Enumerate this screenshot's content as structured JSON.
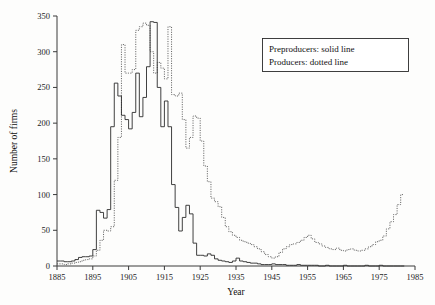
{
  "chart_data": {
    "type": "line",
    "title": "",
    "xlabel": "Year",
    "ylabel": "Number of firms",
    "xlim": [
      1885,
      1985
    ],
    "ylim": [
      0,
      350
    ],
    "xticks": [
      1885,
      1895,
      1905,
      1915,
      1925,
      1935,
      1945,
      1955,
      1965,
      1975,
      1985
    ],
    "yticks": [
      0,
      50,
      100,
      150,
      200,
      250,
      300,
      350
    ],
    "grid": false,
    "legend_position": "top-right",
    "step_style": "steps-post",
    "series": [
      {
        "name": "Preproducers",
        "style": "solid line",
        "x": [
          1885,
          1886,
          1887,
          1888,
          1889,
          1890,
          1891,
          1892,
          1893,
          1894,
          1895,
          1896,
          1897,
          1898,
          1899,
          1900,
          1901,
          1902,
          1903,
          1904,
          1905,
          1906,
          1907,
          1908,
          1909,
          1910,
          1911,
          1912,
          1913,
          1914,
          1915,
          1916,
          1917,
          1918,
          1919,
          1920,
          1921,
          1922,
          1923,
          1924,
          1925,
          1926,
          1927,
          1928,
          1929,
          1930,
          1931,
          1932,
          1933,
          1934,
          1935,
          1936,
          1937,
          1938,
          1939,
          1940,
          1941,
          1942,
          1943,
          1944,
          1945,
          1946,
          1947,
          1948,
          1949,
          1950,
          1951,
          1952,
          1953,
          1954,
          1955,
          1956,
          1957,
          1958,
          1959,
          1960,
          1961,
          1962,
          1963,
          1964,
          1965,
          1966,
          1967,
          1968,
          1969,
          1970,
          1971,
          1972,
          1973,
          1974,
          1975,
          1976,
          1977,
          1978,
          1979,
          1980,
          1981
        ],
        "values": [
          7,
          7,
          6,
          6,
          7,
          9,
          12,
          13,
          13,
          14,
          23,
          78,
          75,
          67,
          79,
          195,
          256,
          238,
          211,
          205,
          192,
          215,
          270,
          209,
          236,
          279,
          342,
          341,
          250,
          195,
          231,
          195,
          114,
          82,
          49,
          68,
          85,
          73,
          32,
          15,
          15,
          14,
          17,
          15,
          10,
          8,
          7,
          6,
          5,
          7,
          11,
          7,
          6,
          5,
          4,
          4,
          3,
          2,
          2,
          2,
          3,
          2,
          2,
          2,
          1,
          1,
          1,
          2,
          1,
          1,
          1,
          1,
          1,
          0,
          0,
          1,
          0,
          0,
          0,
          0,
          1,
          0,
          0,
          0,
          0,
          0,
          1,
          0,
          0,
          0,
          1,
          0,
          0,
          0,
          0,
          0,
          0
        ]
      },
      {
        "name": "Producers",
        "style": "dotted line",
        "x": [
          1885,
          1886,
          1887,
          1888,
          1889,
          1890,
          1891,
          1892,
          1893,
          1894,
          1895,
          1896,
          1897,
          1898,
          1899,
          1900,
          1901,
          1902,
          1903,
          1904,
          1905,
          1906,
          1907,
          1908,
          1909,
          1910,
          1911,
          1912,
          1913,
          1914,
          1915,
          1916,
          1917,
          1918,
          1919,
          1920,
          1921,
          1922,
          1923,
          1924,
          1925,
          1926,
          1927,
          1928,
          1929,
          1930,
          1931,
          1932,
          1933,
          1934,
          1935,
          1936,
          1937,
          1938,
          1939,
          1940,
          1941,
          1942,
          1943,
          1944,
          1945,
          1946,
          1947,
          1948,
          1949,
          1950,
          1951,
          1952,
          1953,
          1954,
          1955,
          1956,
          1957,
          1958,
          1959,
          1960,
          1961,
          1962,
          1963,
          1964,
          1965,
          1966,
          1967,
          1968,
          1969,
          1970,
          1971,
          1972,
          1973,
          1974,
          1975,
          1976,
          1977,
          1978,
          1979,
          1980,
          1981
        ],
        "values": [
          3,
          3,
          2,
          3,
          4,
          5,
          6,
          8,
          9,
          10,
          14,
          22,
          36,
          50,
          49,
          55,
          120,
          180,
          310,
          270,
          270,
          275,
          330,
          335,
          340,
          337,
          300,
          270,
          285,
          277,
          262,
          335,
          240,
          238,
          242,
          205,
          165,
          180,
          210,
          207,
          175,
          140,
          118,
          95,
          90,
          83,
          68,
          55,
          48,
          43,
          40,
          36,
          34,
          32,
          30,
          27,
          24,
          20,
          16,
          13,
          11,
          13,
          19,
          24,
          27,
          30,
          31,
          33,
          36,
          40,
          43,
          38,
          33,
          31,
          28,
          26,
          24,
          23,
          25,
          22,
          21,
          23,
          24,
          22,
          21,
          22,
          24,
          27,
          30,
          34,
          36,
          42,
          52,
          62,
          72,
          86,
          100
        ]
      }
    ]
  },
  "legend": {
    "line1": "Preproducers: solid line",
    "line2": "Producers: dotted line"
  },
  "axes": {
    "x_title": "Year",
    "y_title": "Number of firms",
    "x_tick_labels": [
      "1885",
      "1895",
      "1905",
      "1915",
      "1925",
      "1935",
      "1945",
      "1955",
      "1965",
      "1975",
      "1985"
    ],
    "y_tick_labels": [
      "0",
      "50",
      "100",
      "150",
      "200",
      "250",
      "300",
      "350"
    ]
  },
  "colors": {
    "axis": "#3a3a3a",
    "solid_series": "#2b2b2b",
    "dotted_series": "#555555",
    "background": "#fdfdfc",
    "text": "#111111"
  }
}
